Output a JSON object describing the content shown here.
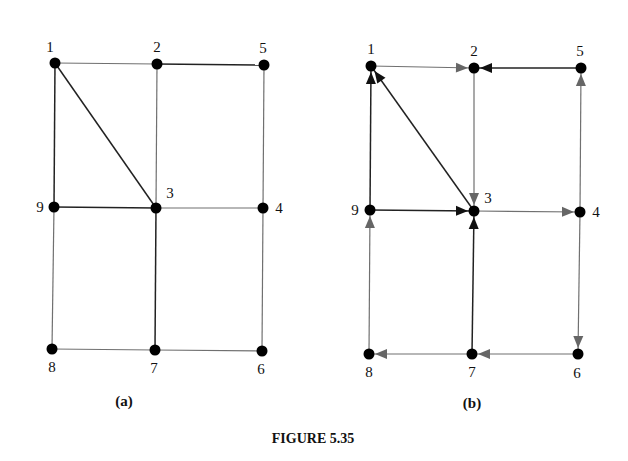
{
  "figure_title": "FIGURE 5.35",
  "colors": {
    "node": "#000000",
    "edge_dark": "#222222",
    "edge_light": "#707070",
    "arrow_dark": "#111111",
    "arrow_light": "#666666",
    "text": "#111111"
  },
  "graphs": [
    {
      "id": "a",
      "caption": "(a)",
      "caption_pos": [
        124,
        406
      ],
      "directed": false,
      "nodes": [
        {
          "id": "1",
          "x": 55,
          "y": 63,
          "lx": 50,
          "ly": 52,
          "anchor": "middle"
        },
        {
          "id": "2",
          "x": 157,
          "y": 64,
          "lx": 157,
          "ly": 52,
          "anchor": "middle"
        },
        {
          "id": "5",
          "x": 264,
          "y": 65,
          "lx": 263,
          "ly": 53,
          "anchor": "middle"
        },
        {
          "id": "9",
          "x": 54,
          "y": 207,
          "lx": 40,
          "ly": 212,
          "anchor": "middle"
        },
        {
          "id": "3",
          "x": 156,
          "y": 208,
          "lx": 170,
          "ly": 198,
          "anchor": "middle"
        },
        {
          "id": "4",
          "x": 263,
          "y": 208,
          "lx": 279,
          "ly": 213,
          "anchor": "middle"
        },
        {
          "id": "8",
          "x": 52,
          "y": 349,
          "lx": 52,
          "ly": 372,
          "anchor": "middle"
        },
        {
          "id": "7",
          "x": 155,
          "y": 350,
          "lx": 154,
          "ly": 373,
          "anchor": "middle"
        },
        {
          "id": "6",
          "x": 262,
          "y": 351,
          "lx": 261,
          "ly": 374,
          "anchor": "middle"
        }
      ],
      "edges": [
        {
          "from": "1",
          "to": "2",
          "style": "light"
        },
        {
          "from": "2",
          "to": "5",
          "style": "dark"
        },
        {
          "from": "1",
          "to": "9",
          "style": "dark"
        },
        {
          "from": "1",
          "to": "3",
          "style": "dark"
        },
        {
          "from": "2",
          "to": "3",
          "style": "light"
        },
        {
          "from": "5",
          "to": "4",
          "style": "light"
        },
        {
          "from": "9",
          "to": "3",
          "style": "dark"
        },
        {
          "from": "3",
          "to": "4",
          "style": "light"
        },
        {
          "from": "9",
          "to": "8",
          "style": "light"
        },
        {
          "from": "3",
          "to": "7",
          "style": "dark"
        },
        {
          "from": "4",
          "to": "6",
          "style": "light"
        },
        {
          "from": "8",
          "to": "7",
          "style": "light"
        },
        {
          "from": "7",
          "to": "6",
          "style": "light"
        }
      ]
    },
    {
      "id": "b",
      "caption": "(b)",
      "caption_pos": [
        472,
        408
      ],
      "directed": true,
      "nodes": [
        {
          "id": "1",
          "x": 371,
          "y": 66,
          "lx": 371,
          "ly": 54,
          "anchor": "middle"
        },
        {
          "id": "2",
          "x": 474,
          "y": 68,
          "lx": 474,
          "ly": 56,
          "anchor": "middle"
        },
        {
          "id": "5",
          "x": 581,
          "y": 68,
          "lx": 580,
          "ly": 56,
          "anchor": "middle"
        },
        {
          "id": "9",
          "x": 370,
          "y": 210,
          "lx": 355,
          "ly": 215,
          "anchor": "middle"
        },
        {
          "id": "3",
          "x": 474,
          "y": 211,
          "lx": 488,
          "ly": 203,
          "anchor": "middle"
        },
        {
          "id": "4",
          "x": 580,
          "y": 212,
          "lx": 596,
          "ly": 217,
          "anchor": "middle"
        },
        {
          "id": "8",
          "x": 369,
          "y": 354,
          "lx": 369,
          "ly": 377,
          "anchor": "middle"
        },
        {
          "id": "7",
          "x": 472,
          "y": 354,
          "lx": 472,
          "ly": 377,
          "anchor": "middle"
        },
        {
          "id": "6",
          "x": 578,
          "y": 354,
          "lx": 577,
          "ly": 378,
          "anchor": "middle"
        }
      ],
      "edges": [
        {
          "from": "1",
          "to": "2",
          "style": "light"
        },
        {
          "from": "5",
          "to": "2",
          "style": "dark"
        },
        {
          "from": "9",
          "to": "1",
          "style": "dark"
        },
        {
          "from": "3",
          "to": "1",
          "style": "dark"
        },
        {
          "from": "2",
          "to": "3",
          "style": "light"
        },
        {
          "from": "4",
          "to": "5",
          "style": "light"
        },
        {
          "from": "9",
          "to": "3",
          "style": "dark"
        },
        {
          "from": "3",
          "to": "4",
          "style": "light"
        },
        {
          "from": "8",
          "to": "9",
          "style": "light"
        },
        {
          "from": "7",
          "to": "3",
          "style": "dark"
        },
        {
          "from": "4",
          "to": "6",
          "style": "light"
        },
        {
          "from": "7",
          "to": "8",
          "style": "light"
        },
        {
          "from": "6",
          "to": "7",
          "style": "light"
        }
      ]
    }
  ]
}
